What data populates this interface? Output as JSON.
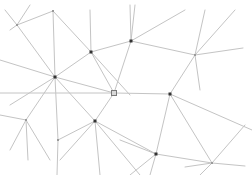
{
  "graph": {
    "background": "#ffffff",
    "edge_color": "#c4c4c4",
    "node_dark_color": "#333333",
    "nodes": [
      {
        "id": "A",
        "x": 17,
        "y": 25,
        "style": "light"
      },
      {
        "id": "B",
        "x": 53,
        "y": 11,
        "style": "light"
      },
      {
        "id": "C",
        "x": 91,
        "y": 52,
        "style": "dark"
      },
      {
        "id": "D",
        "x": 131,
        "y": 41,
        "style": "dark"
      },
      {
        "id": "E",
        "x": 195,
        "y": 55,
        "style": "light"
      },
      {
        "id": "F",
        "x": 55,
        "y": 77,
        "style": "dark"
      },
      {
        "id": "G",
        "x": 114,
        "y": 93,
        "style": "square"
      },
      {
        "id": "H",
        "x": 170,
        "y": 94,
        "style": "dark"
      },
      {
        "id": "I",
        "x": 95,
        "y": 121,
        "style": "dark"
      },
      {
        "id": "J",
        "x": 26,
        "y": 120,
        "style": "light"
      },
      {
        "id": "K",
        "x": 58,
        "y": 140,
        "style": "light"
      },
      {
        "id": "L",
        "x": 156,
        "y": 154,
        "style": "dark"
      },
      {
        "id": "M",
        "x": 212,
        "y": 163,
        "style": "light"
      }
    ],
    "edges": [
      [
        17,
        25,
        53,
        11
      ],
      [
        53,
        11,
        91,
        52
      ],
      [
        53,
        11,
        55,
        77
      ],
      [
        17,
        25,
        55,
        77
      ],
      [
        5,
        10,
        17,
        25
      ],
      [
        10,
        30,
        17,
        25
      ],
      [
        17,
        25,
        30,
        5
      ],
      [
        91,
        52,
        131,
        41
      ],
      [
        91,
        52,
        90,
        10
      ],
      [
        91,
        52,
        55,
        77
      ],
      [
        91,
        52,
        114,
        93
      ],
      [
        91,
        52,
        130,
        95
      ],
      [
        131,
        41,
        185,
        10
      ],
      [
        131,
        41,
        135,
        5
      ],
      [
        131,
        41,
        195,
        55
      ],
      [
        131,
        41,
        114,
        93
      ],
      [
        131,
        41,
        130,
        5
      ],
      [
        195,
        55,
        205,
        10
      ],
      [
        195,
        55,
        235,
        10
      ],
      [
        195,
        55,
        243,
        48
      ],
      [
        195,
        55,
        170,
        94
      ],
      [
        195,
        55,
        200,
        90
      ],
      [
        55,
        77,
        114,
        93
      ],
      [
        55,
        77,
        26,
        120
      ],
      [
        55,
        77,
        58,
        140
      ],
      [
        55,
        77,
        0,
        60
      ],
      [
        55,
        77,
        10,
        105
      ],
      [
        55,
        77,
        95,
        121
      ],
      [
        114,
        93,
        170,
        94
      ],
      [
        114,
        93,
        95,
        121
      ],
      [
        114,
        93,
        0,
        93
      ],
      [
        170,
        94,
        156,
        154
      ],
      [
        170,
        94,
        212,
        163
      ],
      [
        170,
        94,
        252,
        130
      ],
      [
        95,
        121,
        156,
        154
      ],
      [
        95,
        121,
        58,
        140
      ],
      [
        95,
        121,
        60,
        160
      ],
      [
        95,
        121,
        100,
        175
      ],
      [
        95,
        121,
        140,
        175
      ],
      [
        26,
        120,
        10,
        150
      ],
      [
        26,
        120,
        0,
        115
      ],
      [
        26,
        120,
        28,
        160
      ],
      [
        26,
        120,
        50,
        160
      ],
      [
        58,
        140,
        57,
        175
      ],
      [
        156,
        154,
        212,
        163
      ],
      [
        156,
        154,
        130,
        175
      ],
      [
        156,
        154,
        150,
        175
      ],
      [
        156,
        154,
        120,
        140
      ],
      [
        212,
        163,
        245,
        125
      ],
      [
        212,
        163,
        200,
        175
      ],
      [
        212,
        163,
        245,
        166
      ],
      [
        212,
        163,
        185,
        167
      ]
    ]
  }
}
